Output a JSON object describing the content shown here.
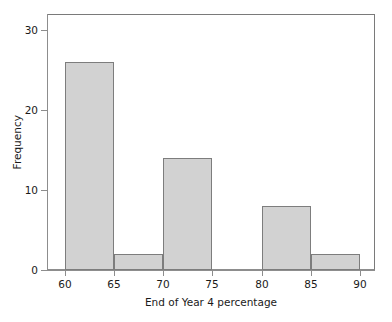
{
  "chart_data": {
    "type": "bar",
    "title": "",
    "subtitle": "",
    "xlabel": "End of Year 4 percentage",
    "ylabel": "Frequency",
    "categories": [
      "60-65",
      "65-70",
      "70-75",
      "75-80",
      "80-85",
      "85-90"
    ],
    "bin_edges": [
      60,
      65,
      70,
      75,
      80,
      85,
      90
    ],
    "values": [
      26,
      2,
      14,
      0,
      8,
      2
    ],
    "bars": [
      {
        "label": "60-65",
        "x0": 60,
        "x1": 65,
        "value": 26
      },
      {
        "label": "65-70",
        "x0": 65,
        "x1": 70,
        "value": 2
      },
      {
        "label": "70-75",
        "x0": 70,
        "x1": 75,
        "value": 14
      },
      {
        "label": "75-80",
        "x0": 75,
        "x1": 80,
        "value": 0
      },
      {
        "label": "80-85",
        "x0": 80,
        "x1": 85,
        "value": 8
      },
      {
        "label": "85-90",
        "x0": 85,
        "x1": 90,
        "value": 2
      }
    ],
    "xlim": [
      58.2,
      91.5
    ],
    "ylim": [
      0,
      32
    ],
    "xticks": [
      60,
      65,
      70,
      75,
      80,
      85,
      90
    ],
    "xtick_labels": [
      "60",
      "65",
      "70",
      "75",
      "80",
      "85",
      "90"
    ],
    "yticks": [
      0,
      10,
      20,
      30
    ],
    "ytick_labels": [
      "0",
      "10",
      "20",
      "30"
    ],
    "grid": false,
    "legend": false,
    "legend_position": "none",
    "bar_fill_color": "#d2d2d2",
    "bar_edge_color": "#7d7d7d",
    "axis_color": "#8d8d8d",
    "background_color": "#ffffff",
    "text_color": "#1a1a1a"
  }
}
